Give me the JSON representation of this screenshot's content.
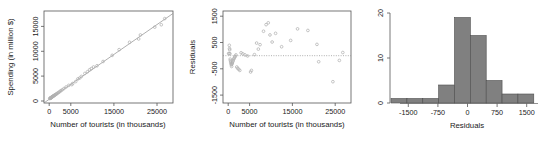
{
  "figure": {
    "panel_count": 3,
    "background": "#ffffff",
    "point_color": "#b0b0b0",
    "line_color": "#8c8c8c",
    "bar_fill": "#808080",
    "bar_stroke": "#4d4d4d",
    "axis_color": "#555555"
  },
  "chart_data": [
    {
      "type": "scatter",
      "name": "spending-vs-tourists",
      "title": "",
      "xlabel": "Number of tourists (in thousands)",
      "ylabel": "Spending (in million $)",
      "xlim": [
        -1200,
        28500
      ],
      "ylim": [
        -900,
        18500
      ],
      "xticks": [
        0,
        5000,
        15000,
        25000
      ],
      "xticklabels": [
        "0",
        "5000",
        "15000",
        "25000"
      ],
      "yticks": [
        0,
        5000,
        10000,
        15000
      ],
      "yticklabels": [
        "0",
        "5000",
        "10000",
        "15000"
      ],
      "grid": false,
      "legend": "none",
      "box": true,
      "fit_line": {
        "type": "linear",
        "intercept": -120,
        "slope": 0.635
      },
      "x": [
        120,
        200,
        260,
        310,
        360,
        420,
        470,
        520,
        600,
        660,
        720,
        800,
        880,
        960,
        1050,
        1150,
        1250,
        1380,
        1500,
        1650,
        1800,
        2000,
        2200,
        2450,
        2700,
        3000,
        3400,
        3900,
        4500,
        5200,
        5400,
        6100,
        6600,
        7000,
        7400,
        8200,
        8800,
        9300,
        9700,
        10200,
        11000,
        12400,
        14500,
        16100,
        18500,
        20600,
        21000,
        24300,
        25800,
        26600
      ],
      "y": [
        40,
        80,
        110,
        150,
        180,
        220,
        250,
        290,
        340,
        380,
        420,
        470,
        520,
        570,
        620,
        690,
        750,
        830,
        900,
        1000,
        1100,
        1220,
        1350,
        1520,
        1700,
        1880,
        2150,
        2480,
        2820,
        2980,
        3200,
        3620,
        4180,
        4350,
        4700,
        5320,
        5680,
        6100,
        6350,
        6700,
        6950,
        7850,
        9150,
        10350,
        11900,
        12600,
        13450,
        15100,
        15600,
        16900
      ]
    },
    {
      "type": "scatter",
      "name": "residuals-vs-tourists",
      "title": "",
      "xlabel": "Number of tourists (in thousands)",
      "ylabel": "Residuals",
      "xlim": [
        -1200,
        28500
      ],
      "ylim": [
        -1800,
        1700
      ],
      "xticks": [
        0,
        5000,
        15000,
        25000
      ],
      "xticklabels": [
        "0",
        "5000",
        "15000",
        "25000"
      ],
      "yticks": [
        -1500,
        -500,
        500,
        1500
      ],
      "yticklabels": [
        "-1500",
        "-500",
        "500",
        "1500"
      ],
      "grid": false,
      "legend": "none",
      "box": true,
      "reference_line": {
        "y": 0,
        "style": "dotted"
      },
      "x": [
        120,
        200,
        260,
        310,
        360,
        420,
        470,
        520,
        600,
        660,
        720,
        800,
        880,
        960,
        1050,
        1150,
        1250,
        1380,
        1500,
        1650,
        1800,
        2000,
        2200,
        2450,
        2700,
        3000,
        3400,
        3900,
        4500,
        5200,
        5400,
        6100,
        6600,
        7000,
        7400,
        8200,
        8800,
        9300,
        9700,
        10200,
        11000,
        12400,
        14500,
        16100,
        18500,
        20600,
        21000,
        24300,
        25800,
        26600
      ],
      "y": [
        85,
        75,
        395,
        270,
        225,
        75,
        -130,
        -190,
        -250,
        -300,
        -350,
        -410,
        -320,
        -280,
        -230,
        -190,
        -140,
        -100,
        -60,
        -20,
        30,
        -430,
        -480,
        -520,
        -560,
        110,
        70,
        30,
        -10,
        -620,
        -560,
        40,
        480,
        250,
        420,
        930,
        1180,
        1250,
        790,
        520,
        850,
        340,
        580,
        1020,
        960,
        430,
        -230,
        -990,
        -180,
        120
      ]
    },
    {
      "type": "bar",
      "name": "residual-histogram",
      "title": "",
      "xlabel": "Residuals",
      "ylabel": "",
      "xlim": [
        -1900,
        1600
      ],
      "ylim": [
        0,
        20
      ],
      "xticks": [
        -1500,
        -750,
        0,
        750,
        1500
      ],
      "xticklabels": [
        "-1500",
        "-750",
        "0",
        "750",
        "1500"
      ],
      "yticks": [
        0,
        10,
        20
      ],
      "yticklabels": [
        "0",
        "10",
        "20"
      ],
      "grid": false,
      "legend": "none",
      "box": false,
      "bin_edges": [
        -1875,
        -1500,
        -1125,
        -750,
        -375,
        0,
        375,
        750,
        1125,
        1500
      ],
      "bin_centers": [
        -1687,
        -1312,
        -937,
        -562,
        -187,
        187,
        562,
        937,
        1312
      ],
      "categories": [
        "-1875..-1500",
        "-1500..-1125",
        "-1125..-750",
        "-750..-375",
        "-375..0",
        "0..375",
        "375..750",
        "750..1125",
        "1125..1500"
      ],
      "values": [
        1,
        1,
        1,
        4,
        19,
        15,
        5,
        2,
        2
      ]
    }
  ]
}
